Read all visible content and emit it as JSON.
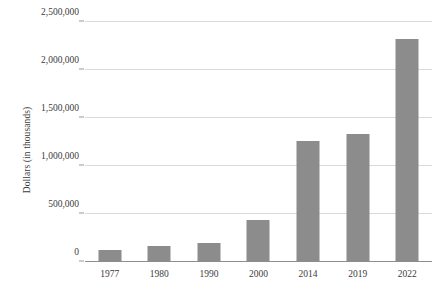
{
  "chart_data": {
    "type": "bar",
    "title": "",
    "xlabel": "",
    "ylabel": "Dollars (in thousands)",
    "categories": [
      "1977",
      "1980",
      "1990",
      "2000",
      "2014",
      "2019",
      "2022"
    ],
    "values": [
      120000,
      170000,
      200000,
      440000,
      1260000,
      1330000,
      2320000
    ],
    "series": [
      {
        "name": "Dollars (in thousands)",
        "values": [
          120000,
          170000,
          200000,
          440000,
          1260000,
          1330000,
          2320000
        ]
      }
    ],
    "ylim": [
      0,
      2500000
    ],
    "yticks": [
      0,
      500000,
      1000000,
      1500000,
      2000000,
      2500000
    ],
    "ytick_labels": [
      "0",
      "500,000",
      "1,000,000",
      "1,500,000",
      "2,000,000",
      "2,500,000"
    ],
    "grid": true,
    "legend": false,
    "legend_position": "none",
    "bar_color": "#8c8c8c",
    "gridline_color": "#d9d9d9",
    "axis_color": "#8f8f8f",
    "background_color": "#ffffff"
  }
}
